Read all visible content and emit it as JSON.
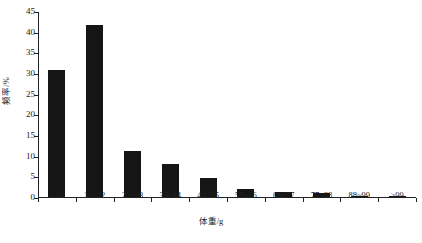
{
  "chart_data": {
    "type": "bar",
    "title": "",
    "xlabel": "体重/g",
    "ylabel": "频率/%",
    "categories": [
      "< 11",
      "11~22",
      "22~33",
      "33~44",
      "44~55",
      "55~66",
      "66~77",
      "77~88",
      "88~99",
      ">99"
    ],
    "values": [
      30.7,
      41.5,
      11.2,
      8.0,
      4.7,
      2.0,
      1.1,
      0.9,
      0.3,
      0.3
    ],
    "ylim": [
      0,
      45
    ],
    "ytick_step": 5,
    "ytick_labels": [
      "0",
      "5",
      "10",
      "15",
      "20",
      "25",
      "30",
      "35",
      "40",
      "45"
    ],
    "grid": false,
    "legend": "none",
    "bar_color": "#151515",
    "axis_color": "#222222",
    "background_color": "#ffffff"
  },
  "axes": {
    "y_title": "频率/%",
    "x_title": "体重/g"
  }
}
